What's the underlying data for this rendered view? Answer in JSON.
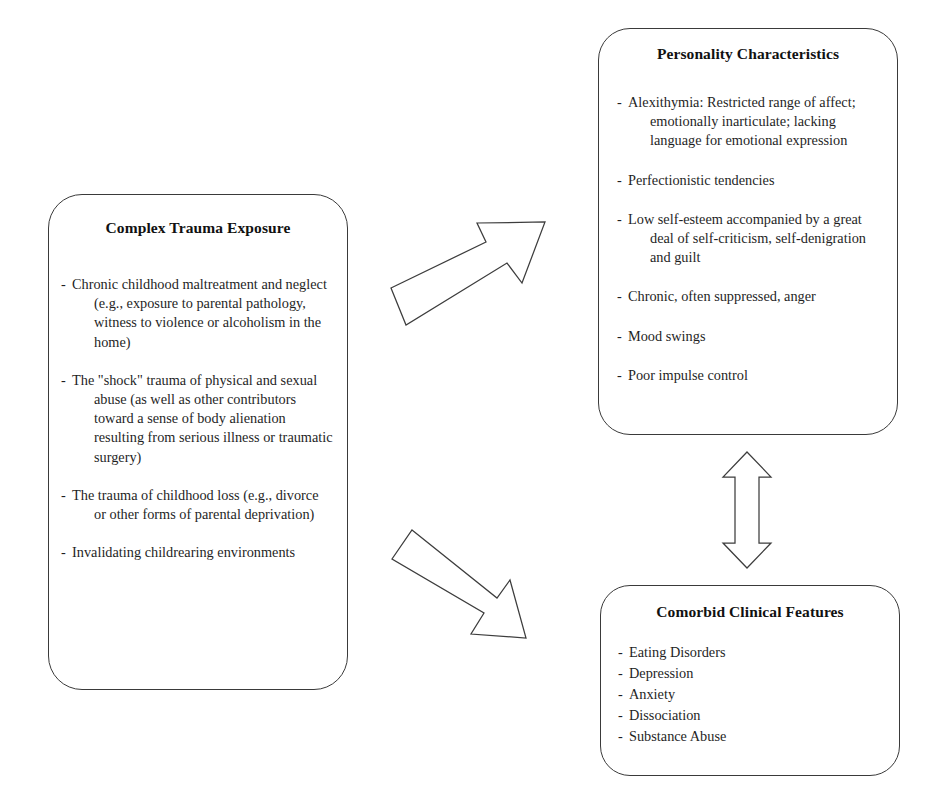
{
  "diagram": {
    "title_hidden": "",
    "boxes": {
      "trauma": {
        "title": "Complex Trauma Exposure",
        "bullets": [
          "Chronic childhood maltreatment and neglect (e.g., exposure to parental pathology, witness to violence or alcoholism in the home)",
          "The \"shock\" trauma of physical and sexual abuse (as well as other contributors toward a sense of body alienation resulting from serious illness or traumatic surgery)",
          "The trauma of childhood loss (e.g., divorce or other forms of parental deprivation)",
          "Invalidating childrearing environments"
        ]
      },
      "personality": {
        "title": "Personality Characteristics",
        "bullets": [
          "Alexithymia: Restricted range of affect; emotionally inarticulate; lacking language for emotional expression",
          "Perfectionistic tendencies",
          "Low self-esteem accompanied by a great deal of self-criticism, self-denigration and guilt",
          "Chronic, often suppressed, anger",
          "Mood swings",
          "Poor impulse control"
        ]
      },
      "comorbid": {
        "title": "Comorbid Clinical Features",
        "bullets": [
          "Eating Disorders",
          "Depression",
          "Anxiety",
          "Dissociation",
          "Substance Abuse"
        ]
      }
    },
    "bullet_marker": "-",
    "arrows": [
      {
        "name": "arrow-trauma-to-personality",
        "direction": "up-right"
      },
      {
        "name": "arrow-trauma-to-comorbid",
        "direction": "down-right"
      },
      {
        "name": "arrow-personality-comorbid-bidirectional",
        "direction": "vertical-double"
      }
    ],
    "colors": {
      "background": "#ffffff",
      "outline": "#3a3a3a",
      "text": "#1b1b1b",
      "arrow_fill": "#ffffff",
      "arrow_stroke": "#3d3d3d"
    }
  }
}
